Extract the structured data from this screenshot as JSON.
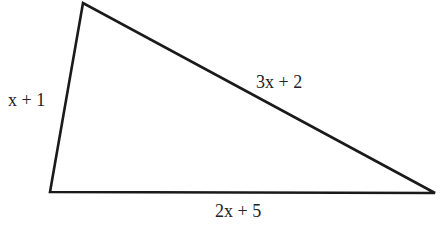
{
  "diagram": {
    "type": "triangle",
    "vertices": {
      "top": [
        83,
        3
      ],
      "bottom_left": [
        50,
        192
      ],
      "bottom_right": [
        435,
        193
      ]
    },
    "stroke_color": "#1a1a1a",
    "sides": {
      "left": {
        "label": "x + 1"
      },
      "hypotenuse": {
        "label": "3x + 2"
      },
      "base": {
        "label": "2x + 5"
      }
    }
  }
}
